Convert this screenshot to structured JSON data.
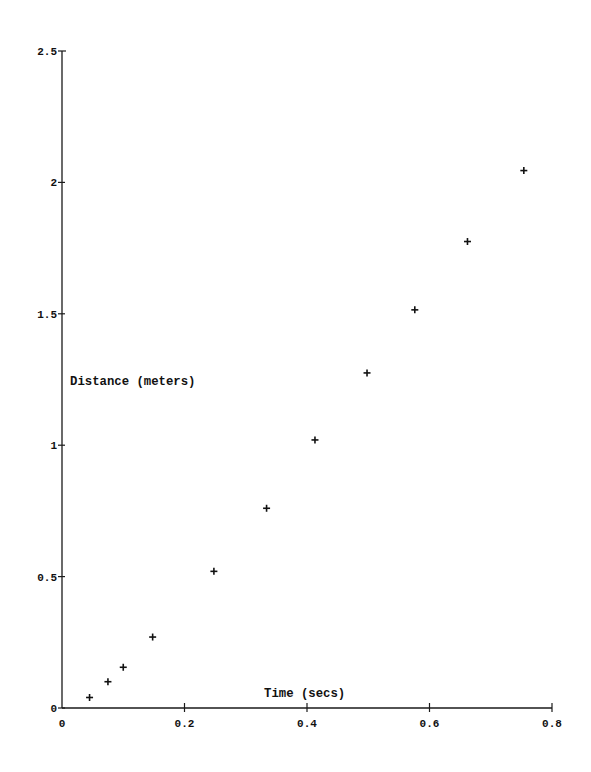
{
  "chart_data": {
    "type": "scatter",
    "title": "",
    "xlabel": "Time (secs)",
    "ylabel": "Distance (meters)",
    "xlim": [
      0,
      0.8
    ],
    "ylim": [
      0,
      2.5
    ],
    "grid": false,
    "legend": null,
    "marker": "+",
    "xticks": [
      0,
      0.2,
      0.4,
      0.6,
      0.8
    ],
    "xtick_labels": [
      "0",
      "0.2",
      "0.4",
      "0.6",
      "0.8"
    ],
    "yticks": [
      0,
      0.5,
      1,
      1.5,
      2,
      2.5
    ],
    "ytick_labels": [
      "0",
      "0.5",
      "1",
      "1.5",
      "2",
      "2.5"
    ],
    "series": [
      {
        "name": "Distance vs Time",
        "x": [
          0.045,
          0.075,
          0.1,
          0.148,
          0.248,
          0.334,
          0.413,
          0.498,
          0.576,
          0.662,
          0.754
        ],
        "y": [
          0.04,
          0.1,
          0.155,
          0.27,
          0.52,
          0.76,
          1.02,
          1.275,
          1.515,
          1.775,
          2.045
        ]
      }
    ]
  },
  "layout": {
    "origin_px": [
      62,
      708
    ],
    "x_end_px": 552,
    "y_top_px": 51,
    "xlabel_pos": [
      264,
      697
    ],
    "ylabel_pos": [
      70,
      385
    ]
  },
  "colors": {
    "ink": "#111111",
    "background": "#ffffff"
  }
}
